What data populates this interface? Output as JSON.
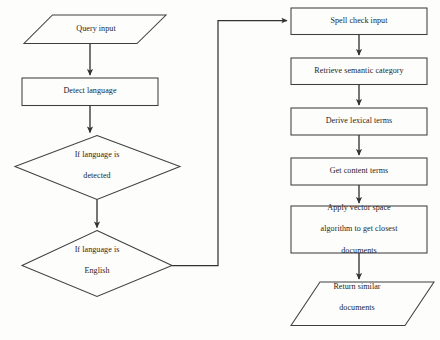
{
  "diagram": {
    "stroke_color": "#3a3a3a",
    "background_color": "#fdfdfc",
    "text_color": "#1d1d1d",
    "nodes": [
      {
        "id": "query_input",
        "shape": "parallelogram",
        "label": "Query input"
      },
      {
        "id": "detect_language",
        "shape": "rectangle",
        "label": "Detect language"
      },
      {
        "id": "if_language_detected",
        "shape": "diamond",
        "label_line1": "If language is",
        "label_line2": "detected"
      },
      {
        "id": "if_language_english",
        "shape": "diamond",
        "label_line1": "If language is",
        "label_line2": "English"
      },
      {
        "id": "spell_check_input",
        "shape": "rectangle",
        "label": "Spell check input"
      },
      {
        "id": "retrieve_semantic_category",
        "shape": "rectangle",
        "label": "Retrieve semantic category"
      },
      {
        "id": "derive_lexical_terms",
        "shape": "rectangle",
        "label": "Derive lexical terms"
      },
      {
        "id": "get_content_terms",
        "shape": "rectangle",
        "label": "Get content terms"
      },
      {
        "id": "apply_vector_space",
        "shape": "rectangle",
        "label_line1": "Apply vector space",
        "label_line2": "algorithm to get closest",
        "label_line3": "documents"
      },
      {
        "id": "return_similar_documents",
        "shape": "parallelogram",
        "label_line1": "Return similar",
        "label_line2": "documents"
      }
    ],
    "edges": [
      {
        "from": "query_input",
        "to": "detect_language",
        "label": ""
      },
      {
        "from": "detect_language",
        "to": "if_language_detected",
        "label": ""
      },
      {
        "from": "if_language_detected",
        "to": "if_language_english",
        "label": ""
      },
      {
        "from": "if_language_english",
        "to": "spell_check_input",
        "label": ""
      },
      {
        "from": "spell_check_input",
        "to": "retrieve_semantic_category",
        "label": ""
      },
      {
        "from": "retrieve_semantic_category",
        "to": "derive_lexical_terms",
        "label": ""
      },
      {
        "from": "derive_lexical_terms",
        "to": "get_content_terms",
        "label": ""
      },
      {
        "from": "get_content_terms",
        "to": "apply_vector_space",
        "label": ""
      },
      {
        "from": "apply_vector_space",
        "to": "return_similar_documents",
        "label": ""
      }
    ]
  }
}
